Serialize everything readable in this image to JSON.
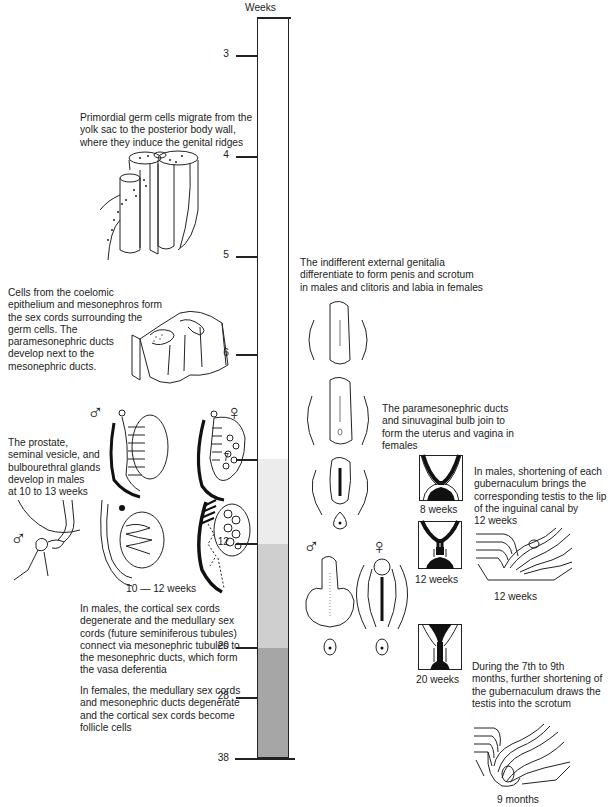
{
  "timeline": {
    "unit_label": "Weeks",
    "ticks": [
      {
        "label": "3",
        "y": 55
      },
      {
        "label": "4",
        "y": 156
      },
      {
        "label": "5",
        "y": 256
      },
      {
        "label": "6",
        "y": 354
      },
      {
        "label": "7",
        "y": 459
      },
      {
        "label": "12",
        "y": 543
      },
      {
        "label": "20",
        "y": 647
      },
      {
        "label": "28",
        "y": 697
      },
      {
        "label": "38",
        "y": 759
      }
    ],
    "bands": [
      {
        "from_week": "3",
        "to_week": "7",
        "color": "#ffffff"
      },
      {
        "from_week": "7",
        "to_week": "12",
        "color": "#ececec"
      },
      {
        "from_week": "12",
        "to_week": "20",
        "color": "#cfcfcf"
      },
      {
        "from_week": "20",
        "to_week": "38",
        "color": "#a6a6a6"
      }
    ]
  },
  "left_column": {
    "germ_cells_text": "Primordial germ cells migrate from the\nyolk sac to the posterior body wall,\nwhere they induce the genital ridges",
    "sex_cords_text": "Cells from the coelomic\nepithelium and mesonephros form\nthe sex cords surrounding the\ngerm cells.  The\nparamesonephric ducts\ndevelop next to the\nmesonephric ducts.",
    "glands_text": "The prostate,\nseminal vesicle, and\nbulbourethral glands\ndevelop in males\nat 10 to 13 weeks",
    "gonads_caption": "10 — 12 weeks",
    "male_cords_text": "In males, the cortical sex cords\ndegenerate and the medullary sex\ncords (future seminiferous tubules)\nconnect via mesonephric tubules to\nthe mesonephric ducts, which form\nthe vasa deferentia",
    "female_cords_text": "In females, the medullary sex cords\nand mesonephric ducts degenerate\nand the cortical sex cords become\nfollicle cells",
    "male_symbol": "♂",
    "female_symbol": "♀"
  },
  "right_column": {
    "external_genitalia_text": "The indifferent external genitalia\ndifferentiate to form penis and scrotum\nin males and clitoris and labia in females",
    "uterus_text": "The paramesonephric ducts\nand sinuvaginal bulb join to\nform the uterus and vagina in\nfemales",
    "gubernaculum_text": "In males, shortening of each\ngubernaculum brings the\ncorresponding testis to the lip\nof the inguinal canal by\n12 weeks",
    "descent_text": "During the 7th to 9th\nmonths, further shortening of\nthe gubernaculum draws the\ntestis into the scrotum",
    "box_captions": [
      "8 weeks",
      "12 weeks",
      "20 weeks"
    ],
    "canal_12_caption": "12 weeks",
    "canal_9m_caption": "9 months",
    "male_symbol": "♂",
    "female_symbol": "♀"
  }
}
